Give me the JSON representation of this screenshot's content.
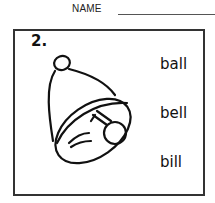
{
  "header": {
    "name_label": "NAME"
  },
  "question": {
    "number": "2.",
    "picture": "bell-icon",
    "choices": [
      "ball",
      "bell",
      "bill"
    ]
  }
}
